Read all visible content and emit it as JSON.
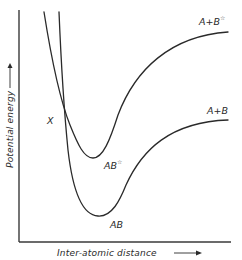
{
  "diagram": {
    "title": "",
    "x_axis": {
      "label": "Inter-atomic distance",
      "arrow": "→"
    },
    "y_axis": {
      "label": "Potential energy",
      "arrow": "→"
    },
    "crossing_label": "X",
    "curves": [
      {
        "id": "excited",
        "min_label": "AB",
        "min_label_sup": "☆",
        "asymptote_label": "A+B",
        "asymptote_label_sup": "☆"
      },
      {
        "id": "ground",
        "min_label": "AB",
        "min_label_sup": "",
        "asymptote_label": "A+B",
        "asymptote_label_sup": ""
      }
    ],
    "colors": {
      "ink": "#2a2a2a",
      "background": "#ffffff"
    }
  }
}
